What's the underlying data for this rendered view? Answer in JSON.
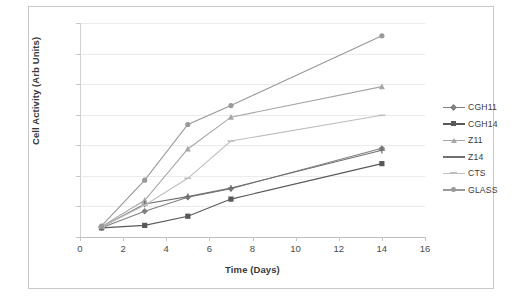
{
  "chart_data": {
    "type": "line",
    "title": "",
    "xlabel": "Time (Days)",
    "ylabel": "Cell Activity (Arb Units)",
    "xlim": [
      0,
      16
    ],
    "ylim": [
      0,
      3500
    ],
    "xticks": [
      0,
      2,
      4,
      6,
      8,
      10,
      12,
      14,
      16
    ],
    "yticks": [
      0,
      500,
      1000,
      1500,
      2000,
      2500,
      3000,
      3500
    ],
    "grid": true,
    "legend_position": "right",
    "x": [
      1,
      3,
      5,
      7,
      14
    ],
    "series": [
      {
        "name": "CGH11",
        "values": [
          150,
          420,
          650,
          790,
          1450
        ],
        "color": "#808080",
        "marker": "diamond"
      },
      {
        "name": "CGH14",
        "values": [
          150,
          190,
          340,
          620,
          1200
        ],
        "color": "#595959",
        "marker": "square"
      },
      {
        "name": "Z11",
        "values": [
          170,
          600,
          1440,
          1960,
          2460
        ],
        "color": "#a6a6a6",
        "marker": "triangle"
      },
      {
        "name": "Z14",
        "values": [
          160,
          540,
          660,
          800,
          1420
        ],
        "color": "#707070",
        "marker": "cross"
      },
      {
        "name": "CTS",
        "values": [
          165,
          520,
          960,
          1570,
          1990
        ],
        "color": "#bfbfbf",
        "marker": "dash"
      },
      {
        "name": "GLASS",
        "values": [
          180,
          930,
          1840,
          2150,
          3290
        ],
        "color": "#999999",
        "marker": "circle"
      }
    ]
  },
  "axis": {
    "y_tick_labels": [
      "0",
      "500",
      "1000",
      "1500",
      "2000",
      "2500",
      "3000",
      "3500"
    ],
    "x_tick_labels": [
      "0",
      "2",
      "4",
      "6",
      "8",
      "10",
      "12",
      "14",
      "16"
    ],
    "y_title": "Cell Activity (Arb Units)",
    "x_title": "Time (Days)"
  },
  "legend": {
    "items": [
      {
        "label": "CGH11"
      },
      {
        "label": "CGH14"
      },
      {
        "label": "Z11"
      },
      {
        "label": "Z14"
      },
      {
        "label": "CTS"
      },
      {
        "label": "GLASS"
      }
    ]
  }
}
